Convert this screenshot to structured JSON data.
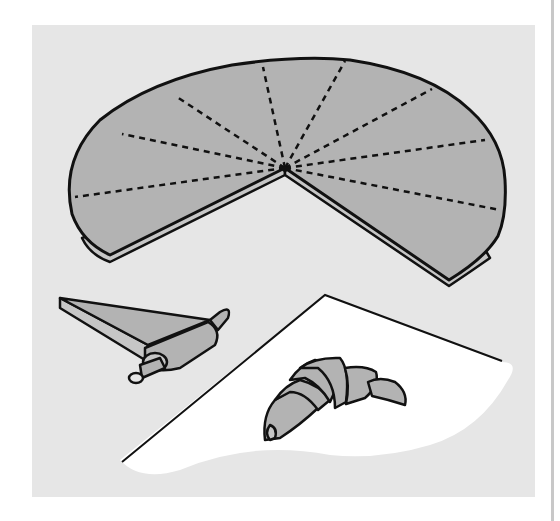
{
  "illustration": {
    "subject": "croissant-making steps",
    "caption": "",
    "colors": {
      "background": "#e6e6e6",
      "page": "#ffffff",
      "dough": "#b3b3b3",
      "dough_edge": "#c6c6c6",
      "outline": "#111111",
      "paper": "#ffffff"
    },
    "elements": [
      {
        "name": "dough-circle",
        "description": "Rolled dough circle with one wedge removed, cut lines dashed"
      },
      {
        "name": "rolling-wedge",
        "description": "Triangle of dough being rolled up"
      },
      {
        "name": "paper-sheet",
        "description": "White sheet of paper"
      },
      {
        "name": "finished-croissant",
        "description": "Shaped croissant on paper"
      }
    ]
  }
}
